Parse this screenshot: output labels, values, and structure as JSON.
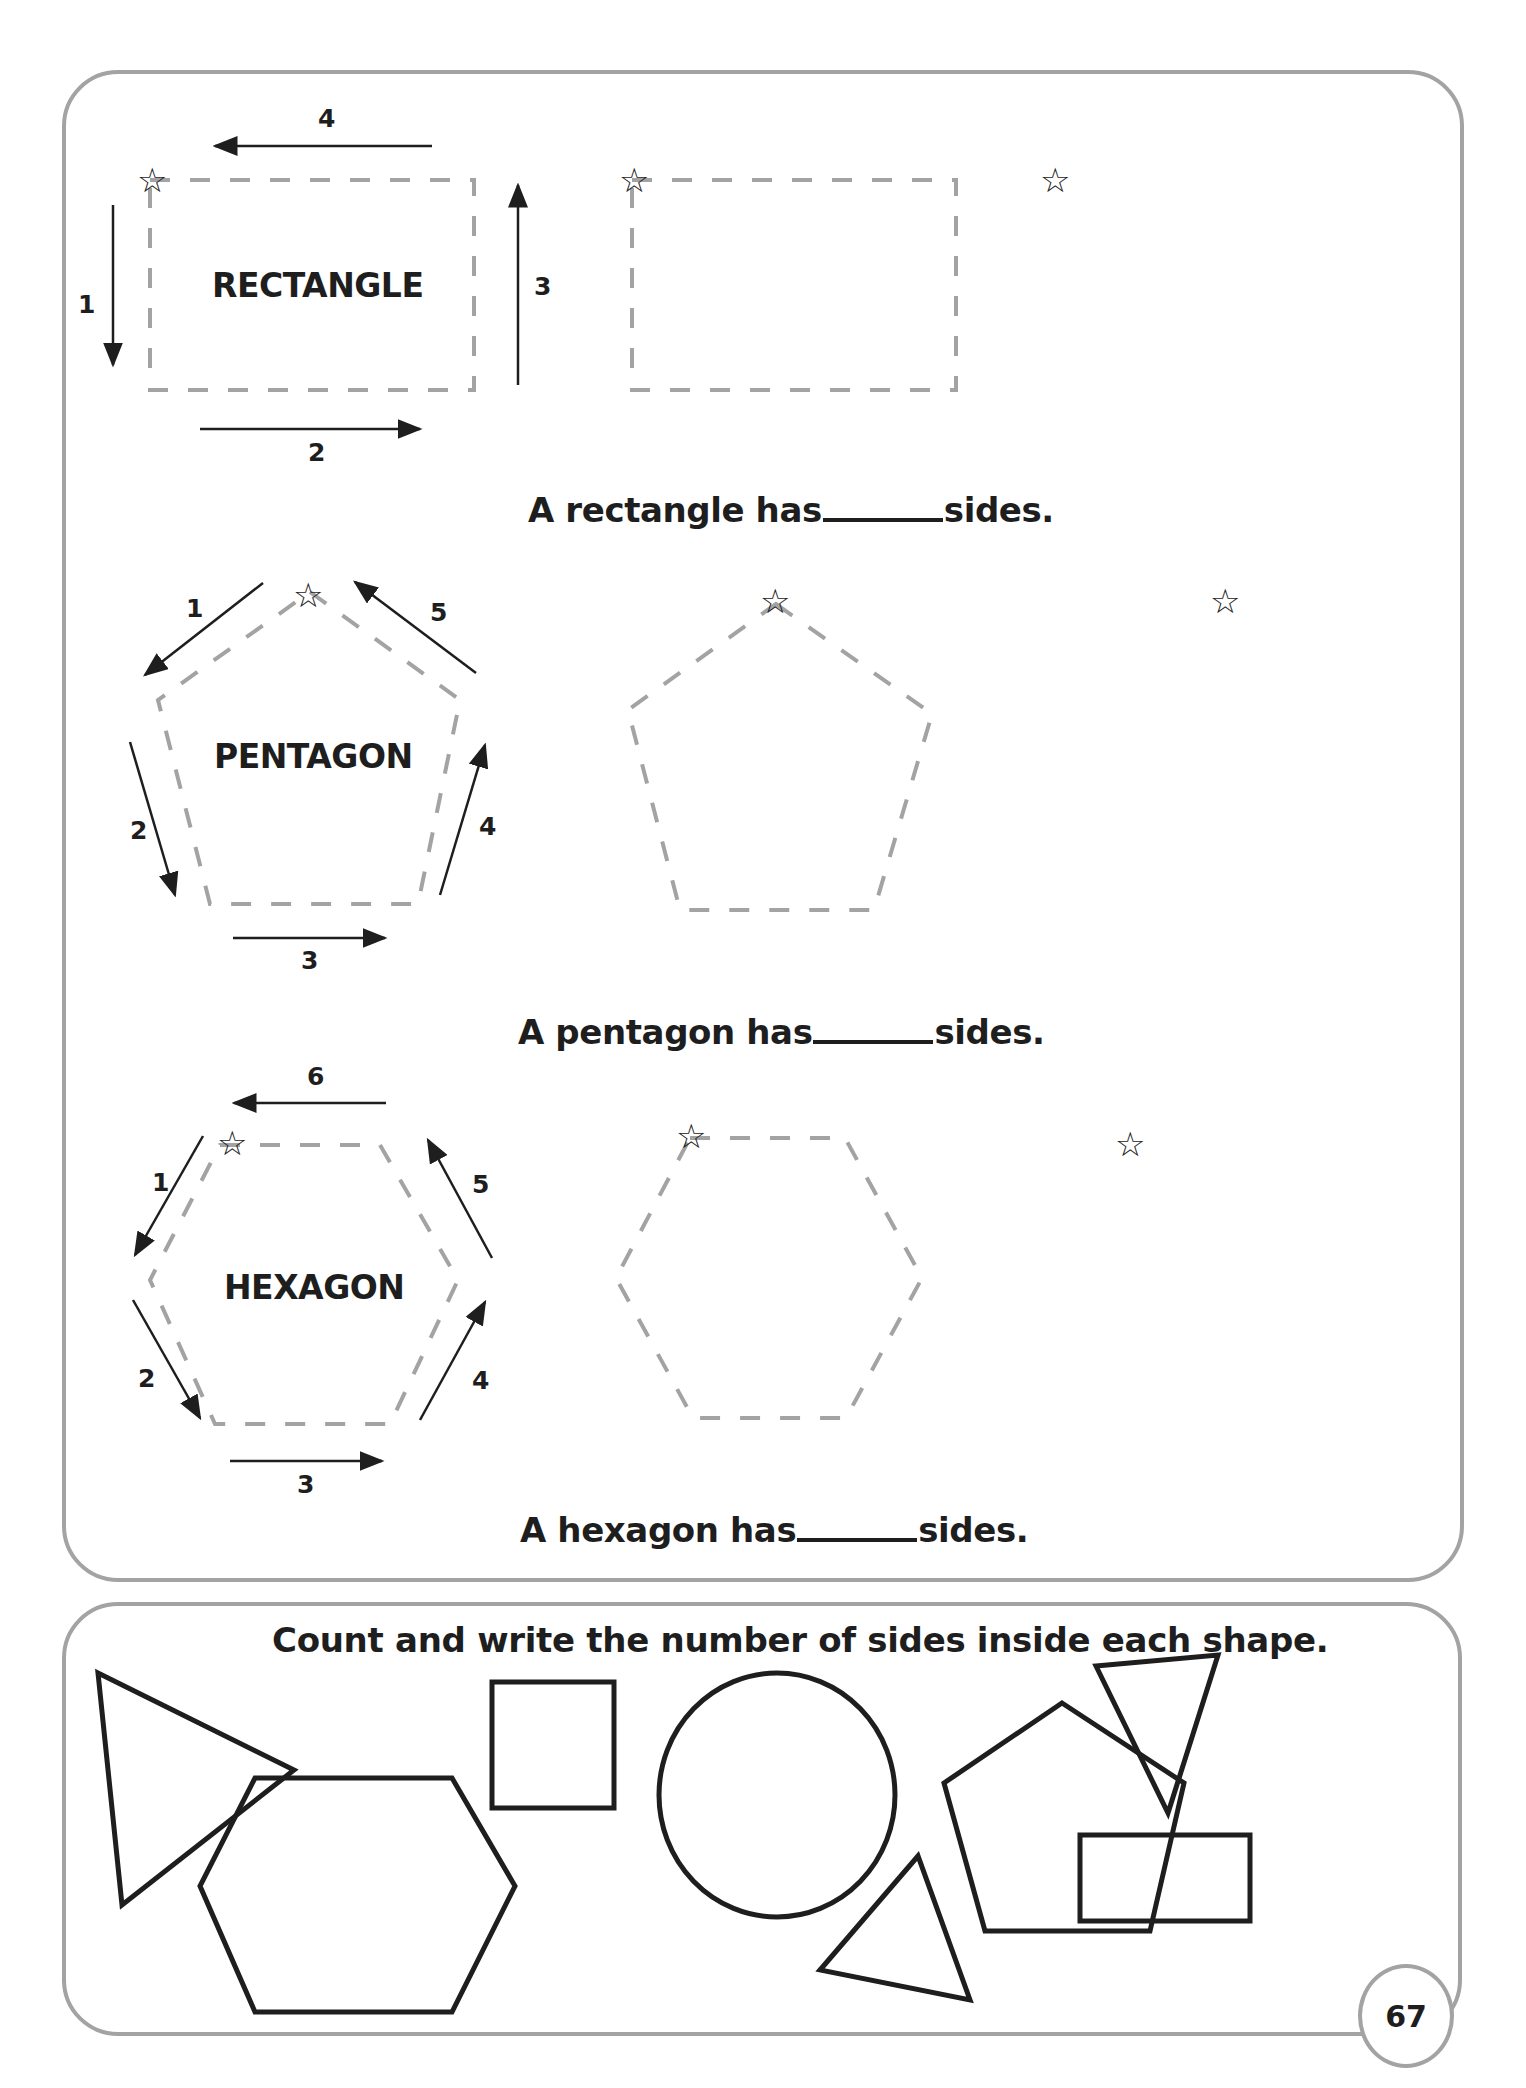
{
  "page_number": "67",
  "colors": {
    "dashed_outline": "#a3a3a3",
    "ink": "#1e1e1e",
    "panel_border": "#a3a3a3"
  },
  "tracing_section": {
    "rows": [
      {
        "shape": "rectangle",
        "model_label": "RECTANGLE",
        "side_numbers": [
          "1",
          "2",
          "3",
          "4"
        ],
        "sentence_before": "A rectangle has",
        "sentence_after": "sides.",
        "start_marker": "star-icon"
      },
      {
        "shape": "pentagon",
        "model_label": "PENTAGON",
        "side_numbers": [
          "1",
          "2",
          "3",
          "4",
          "5"
        ],
        "sentence_before": "A pentagon has",
        "sentence_after": "sides.",
        "start_marker": "star-icon"
      },
      {
        "shape": "hexagon",
        "model_label": "HEXAGON",
        "side_numbers": [
          "1",
          "2",
          "3",
          "4",
          "5",
          "6"
        ],
        "sentence_before": "A hexagon has",
        "sentence_after": "sides.",
        "start_marker": "star-icon"
      }
    ]
  },
  "count_section": {
    "instruction": "Count and write the number of sides inside each shape.",
    "shapes": [
      "triangle",
      "hexagon",
      "square",
      "circle",
      "triangle",
      "pentagon",
      "triangle",
      "rectangle"
    ]
  },
  "icons": {
    "star": "☆"
  }
}
